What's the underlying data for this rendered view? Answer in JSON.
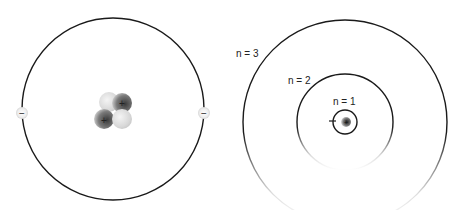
{
  "diagrams": [
    {
      "name": "helium-atom",
      "electrons": [
        {
          "charge": "−"
        },
        {
          "charge": "−"
        }
      ],
      "nucleus": [
        {
          "type": "neutron",
          "charge": ""
        },
        {
          "type": "proton",
          "charge": "+"
        },
        {
          "type": "proton",
          "charge": "+"
        },
        {
          "type": "neutron",
          "charge": ""
        }
      ]
    },
    {
      "name": "bohr-model",
      "orbits": [
        {
          "label": "n = 1"
        },
        {
          "label": "n = 2"
        },
        {
          "label": "n = 3"
        }
      ],
      "electron_charge": "−",
      "nucleus_charge": "+"
    }
  ],
  "colors": {
    "line": "#1a1a1a",
    "proton": "#555555",
    "neutron": "#cccccc"
  }
}
